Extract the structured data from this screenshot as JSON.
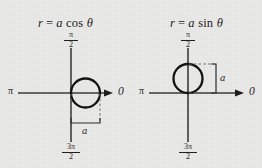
{
  "figure": {
    "type": "polar-circle-diagram-pair",
    "background_color": "#e9e9e7",
    "ink_color": "#1c1c1c"
  },
  "panels": [
    {
      "id": "cosine",
      "title": {
        "lhs": "r",
        "equals": "=",
        "coefficient": "a",
        "function": "cos",
        "variable": "θ",
        "full": "r = a cos θ"
      },
      "axes": {
        "right_label": "0",
        "left_label": "π",
        "top_label": {
          "numerator": "π",
          "denominator": "2"
        },
        "bottom_label": {
          "numerator": "3π",
          "denominator": "2"
        }
      },
      "circle": {
        "position": "right-of-origin",
        "tangent_at": "origin",
        "diameter_label": "a"
      },
      "measure": {
        "label": "a",
        "orientation": "horizontal",
        "placement": "below-circle"
      }
    },
    {
      "id": "sine",
      "title": {
        "lhs": "r",
        "equals": "=",
        "coefficient": "a",
        "function": "sin",
        "variable": "θ",
        "full": "r = a sin θ"
      },
      "axes": {
        "right_label": "0",
        "left_label": "π",
        "top_label": {
          "numerator": "π",
          "denominator": "2"
        },
        "bottom_label": {
          "numerator": "3π",
          "denominator": "2"
        }
      },
      "circle": {
        "position": "above-origin",
        "tangent_at": "origin",
        "diameter_label": "a"
      },
      "measure": {
        "label": "a",
        "orientation": "vertical",
        "placement": "right-of-circle"
      }
    }
  ]
}
